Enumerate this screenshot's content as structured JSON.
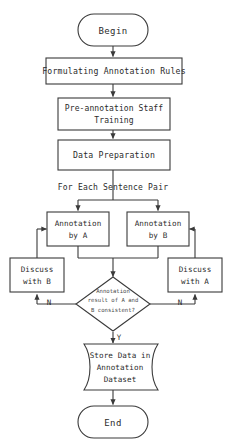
{
  "diagram": {
    "title_visible": false,
    "colors": {
      "background": "#ffffff",
      "stroke": "#3a3a3a",
      "text": "#2b2b2b",
      "fill": "#ffffff"
    },
    "nodes": {
      "begin": {
        "label": "Begin",
        "shape": "terminator"
      },
      "rules": {
        "label": "Formulating Annotation Rules",
        "shape": "process"
      },
      "training": {
        "line1": "Pre-annotation Staff",
        "line2": "Training",
        "shape": "process"
      },
      "data_prep": {
        "label": "Data Preparation",
        "shape": "process"
      },
      "annotation_a": {
        "line1": "Annotation",
        "line2": "by A",
        "shape": "process"
      },
      "annotation_b": {
        "line1": "Annotation",
        "line2": "by B",
        "shape": "process"
      },
      "discuss_b": {
        "line1": "Discuss",
        "line2": "with B",
        "shape": "process"
      },
      "discuss_a": {
        "line1": "Discuss",
        "line2": "with A",
        "shape": "process"
      },
      "decision": {
        "line1": "Annotation",
        "line2": "result of A and",
        "line3": "B consistent?",
        "shape": "decision"
      },
      "store": {
        "line1": "Store Data in",
        "line2": "Annotation",
        "line3": "Dataset",
        "shape": "stored-data"
      },
      "end": {
        "label": "End",
        "shape": "terminator"
      }
    },
    "edge_labels": {
      "loop_header": "For Each Sentence Pair",
      "no_left": "N",
      "no_right": "N",
      "yes": "Y"
    }
  }
}
